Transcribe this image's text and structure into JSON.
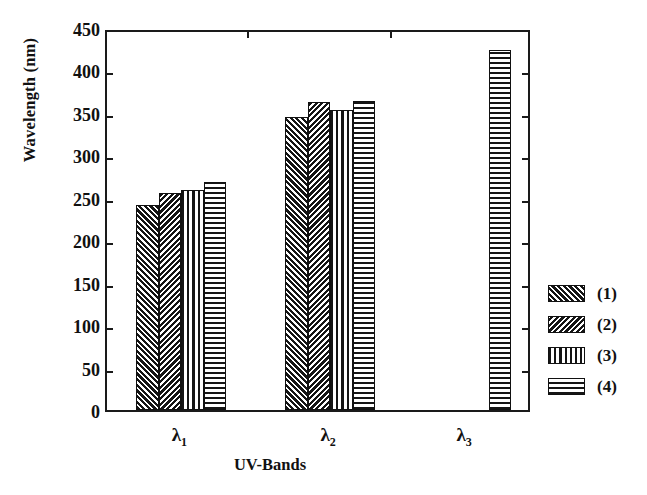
{
  "chart_data": {
    "type": "bar",
    "title": "",
    "xlabel": "UV-Bands",
    "ylabel": "Wavelength (nm)",
    "categories": [
      "λ1",
      "λ2",
      "λ3"
    ],
    "category_labels_html": [
      "λ<sub>1</sub>",
      "λ<sub>2</sub>",
      "λ<sub>3</sub>"
    ],
    "ylim": [
      0,
      450
    ],
    "yticks": [
      0,
      50,
      100,
      150,
      200,
      250,
      300,
      350,
      400,
      450
    ],
    "ytick_labels": [
      "0",
      "50",
      "100",
      "150",
      "200",
      "250",
      "300",
      "350",
      "400",
      "450"
    ],
    "grid": false,
    "legend_position": "right-outside",
    "series": [
      {
        "name": "(1)",
        "pattern": "forward-diagonal-hatch",
        "values": [
          241,
          345,
          null
        ]
      },
      {
        "name": "(2)",
        "pattern": "backward-diagonal-hatch",
        "values": [
          256,
          363,
          null
        ]
      },
      {
        "name": "(3)",
        "pattern": "vertical-lines",
        "values": [
          259,
          354,
          null
        ]
      },
      {
        "name": "(4)",
        "pattern": "horizontal-lines",
        "values": [
          269,
          364,
          424
        ]
      }
    ]
  },
  "legend": {
    "entries": [
      {
        "label": "(1)"
      },
      {
        "label": "(2)"
      },
      {
        "label": "(3)"
      },
      {
        "label": "(4)"
      }
    ]
  },
  "colors": {
    "ink": "#111111",
    "background": "#ffffff"
  }
}
